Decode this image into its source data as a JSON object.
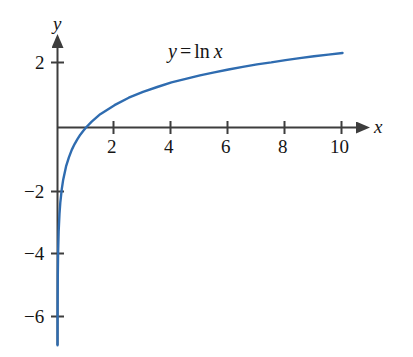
{
  "chart_data": {
    "type": "line",
    "title": "",
    "annotation": "y = ln x",
    "annotation_parts": {
      "dependent": "y",
      "equals": "=",
      "function": "ln",
      "independent": "x"
    },
    "xlabel": "x",
    "ylabel": "y",
    "xlim": [
      -0.2,
      11.2
    ],
    "ylim": [
      -6.8,
      2.6
    ],
    "grid": false,
    "legend": null,
    "xticks": [
      2,
      4,
      6,
      8,
      10
    ],
    "xtick_labels": [
      "2",
      "4",
      "6",
      "8",
      "10"
    ],
    "yticks": [
      2,
      -2,
      -4,
      -6
    ],
    "ytick_labels": [
      "2",
      "−2",
      "−4",
      "−6"
    ],
    "series": [
      {
        "name": "y = ln x",
        "color": "#2f6cb0",
        "x": [
          0.0012,
          0.0025,
          0.005,
          0.01,
          0.02,
          0.04,
          0.07,
          0.1,
          0.15,
          0.2,
          0.3,
          0.4,
          0.5,
          0.6,
          0.7,
          0.8,
          0.9,
          1.0,
          1.2,
          1.5,
          2.0,
          2.5,
          3.0,
          3.5,
          4.0,
          4.5,
          5.0,
          5.5,
          6.0,
          6.5,
          7.0,
          7.5,
          8.0,
          8.5,
          9.0,
          9.5,
          10.0
        ],
        "y": [
          -6.72,
          -5.99,
          -5.3,
          -4.61,
          -3.91,
          -3.22,
          -2.66,
          -2.3,
          -1.9,
          -1.61,
          -1.2,
          -0.92,
          -0.69,
          -0.51,
          -0.36,
          -0.22,
          -0.11,
          0.0,
          0.18,
          0.41,
          0.69,
          0.92,
          1.1,
          1.25,
          1.39,
          1.5,
          1.61,
          1.7,
          1.79,
          1.87,
          1.95,
          2.01,
          2.08,
          2.14,
          2.2,
          2.25,
          2.3
        ]
      }
    ]
  },
  "colors": {
    "curve": "#2f6cb0",
    "axis": "#3d3d3d",
    "text": "#151515",
    "background": "#ffffff"
  }
}
